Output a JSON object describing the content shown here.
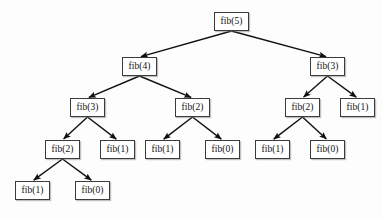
{
  "diagram": {
    "type": "recursion-tree",
    "background_color": "#fdfdfd",
    "node_border_color": "#3b3b3b",
    "node_fill_color": "#ffffff",
    "edge_color": "#101010",
    "node_width": 35,
    "node_height": 19,
    "nodes": [
      {
        "id": "n0",
        "label": "fib(5)",
        "x": 214,
        "y": 12,
        "level": 0
      },
      {
        "id": "n1",
        "label": "fib(4)",
        "x": 122,
        "y": 57,
        "level": 1
      },
      {
        "id": "n2",
        "label": "fib(3)",
        "x": 310,
        "y": 57,
        "level": 1
      },
      {
        "id": "n3",
        "label": "fib(3)",
        "x": 70,
        "y": 98,
        "level": 2
      },
      {
        "id": "n4",
        "label": "fib(2)",
        "x": 175,
        "y": 98,
        "level": 2
      },
      {
        "id": "n5",
        "label": "fib(2)",
        "x": 285,
        "y": 98,
        "level": 2
      },
      {
        "id": "n6",
        "label": "fib(1)",
        "x": 340,
        "y": 98,
        "level": 2
      },
      {
        "id": "n7",
        "label": "fib(2)",
        "x": 45,
        "y": 140,
        "level": 3
      },
      {
        "id": "n8",
        "label": "fib(1)",
        "x": 100,
        "y": 140,
        "level": 3
      },
      {
        "id": "n9",
        "label": "fib(1)",
        "x": 145,
        "y": 140,
        "level": 3
      },
      {
        "id": "n10",
        "label": "fib(0)",
        "x": 205,
        "y": 140,
        "level": 3
      },
      {
        "id": "n11",
        "label": "fib(1)",
        "x": 255,
        "y": 140,
        "level": 3
      },
      {
        "id": "n12",
        "label": "fib(0)",
        "x": 310,
        "y": 140,
        "level": 3
      },
      {
        "id": "n13",
        "label": "fib(1)",
        "x": 15,
        "y": 181,
        "level": 4
      },
      {
        "id": "n14",
        "label": "fib(0)",
        "x": 75,
        "y": 181,
        "level": 4
      }
    ],
    "edges": [
      {
        "from": "n0",
        "to": "n1"
      },
      {
        "from": "n0",
        "to": "n2"
      },
      {
        "from": "n1",
        "to": "n3"
      },
      {
        "from": "n1",
        "to": "n4"
      },
      {
        "from": "n2",
        "to": "n5"
      },
      {
        "from": "n2",
        "to": "n6"
      },
      {
        "from": "n3",
        "to": "n7"
      },
      {
        "from": "n3",
        "to": "n8"
      },
      {
        "from": "n4",
        "to": "n9"
      },
      {
        "from": "n4",
        "to": "n10"
      },
      {
        "from": "n5",
        "to": "n11"
      },
      {
        "from": "n5",
        "to": "n12"
      },
      {
        "from": "n7",
        "to": "n13"
      },
      {
        "from": "n7",
        "to": "n14"
      }
    ]
  }
}
